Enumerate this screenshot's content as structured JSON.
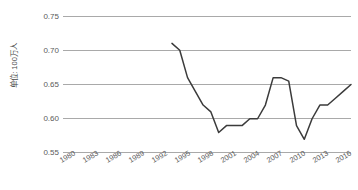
{
  "chart_data": {
    "type": "line",
    "title": "",
    "subtitle": "",
    "xlabel": "",
    "ylabel": "单位: 100万人",
    "ylim": [
      0.55,
      0.75
    ],
    "ytick_values": [
      0.75,
      0.7,
      0.65,
      0.6,
      0.55
    ],
    "ytick_labels": [
      "0.75",
      "0.70",
      "0.65",
      "0.60",
      "0.55"
    ],
    "xlim": [
      1980,
      2017
    ],
    "xtick_labels": [
      "1980",
      "1983",
      "1986",
      "1989",
      "1992",
      "1995",
      "1998",
      "2001",
      "2004",
      "2007",
      "2010",
      "2013",
      "2016"
    ],
    "xtick_values": [
      1980,
      1983,
      1986,
      1989,
      1992,
      1995,
      1998,
      2001,
      2004,
      2007,
      2010,
      2013,
      2016
    ],
    "grid": "horizontal",
    "legend": "none",
    "series": [
      {
        "name": "",
        "color": "#3b3b3b",
        "x": [
          1994,
          1995,
          1996,
          1997,
          1998,
          1999,
          2000,
          2001,
          2002,
          2003,
          2004,
          2005,
          2006,
          2007,
          2008,
          2009,
          2010,
          2011,
          2012,
          2013,
          2014,
          2015,
          2016,
          2017
        ],
        "values": [
          0.71,
          0.7,
          0.66,
          0.64,
          0.62,
          0.61,
          0.58,
          0.59,
          0.59,
          0.59,
          0.6,
          0.6,
          0.62,
          0.66,
          0.66,
          0.655,
          0.59,
          0.57,
          0.6,
          0.62,
          0.62,
          0.63,
          0.64,
          0.65
        ]
      }
    ]
  },
  "axis": {
    "y_title": "单位: 100万人"
  }
}
